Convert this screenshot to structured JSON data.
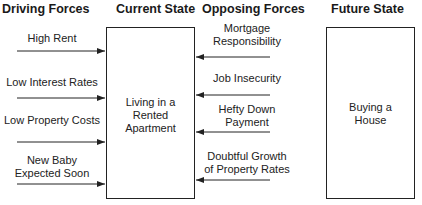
{
  "headers": {
    "driving": "Driving Forces",
    "current": "Current State",
    "opposing": "Opposing Forces",
    "future": "Future State"
  },
  "current_state": {
    "line1": "Living in a",
    "line2": "Rented",
    "line3": "Apartment"
  },
  "future_state": {
    "line1": "Buying a",
    "line2": "House"
  },
  "driving_forces": [
    {
      "line1": "High Rent",
      "line2": ""
    },
    {
      "line1": "Low Interest Rates",
      "line2": ""
    },
    {
      "line1": "Low Property Costs",
      "line2": ""
    },
    {
      "line1": "New Baby",
      "line2": "Expected Soon"
    }
  ],
  "opposing_forces": [
    {
      "line1": "Mortgage",
      "line2": "Responsibility"
    },
    {
      "line1": "Job Insecurity",
      "line2": ""
    },
    {
      "line1": "Hefty Down",
      "line2": "Payment"
    },
    {
      "line1": "Doubtful Growth",
      "line2": "of Property Rates"
    }
  ],
  "colors": {
    "line": "#222222",
    "background": "#ffffff"
  }
}
